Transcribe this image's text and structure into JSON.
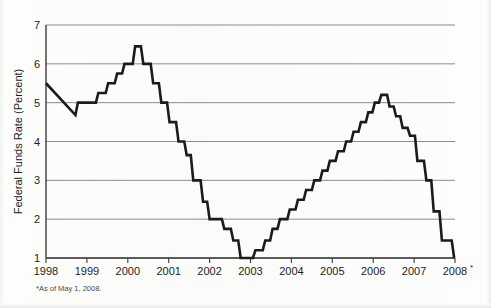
{
  "chart_data": {
    "type": "line",
    "subtype": "step",
    "title": "",
    "xlabel": "",
    "ylabel": "Federal Funds Rate (Percent)",
    "ylim": [
      1,
      7
    ],
    "xlim": [
      1998,
      2008
    ],
    "yticks": [
      1,
      2,
      3,
      4,
      5,
      6,
      7
    ],
    "ytick_labels": [
      "1",
      "2",
      "3",
      "4",
      "5",
      "6",
      "7"
    ],
    "xticks": [
      1998,
      1999,
      2000,
      2001,
      2002,
      2003,
      2004,
      2005,
      2006,
      2007,
      2008
    ],
    "xtick_labels": [
      "1998",
      "1999",
      "2000",
      "2001",
      "2002",
      "2003",
      "2004",
      "2005",
      "2006",
      "2007",
      "2008"
    ],
    "grid": "horizontal",
    "legend": "none",
    "line_color": "#1b1b1b",
    "grid_color": "#6f6f6f",
    "footnote_marker": "*",
    "footnote": "*As of May 1, 2008.",
    "x_last_label_marker": "*",
    "series": [
      {
        "name": "Federal Funds Rate",
        "points": [
          [
            1998.0,
            5.5
          ],
          [
            1998.72,
            4.68
          ],
          [
            1998.78,
            5.0
          ],
          [
            1999.22,
            5.0
          ],
          [
            1999.28,
            5.25
          ],
          [
            1999.46,
            5.25
          ],
          [
            1999.52,
            5.5
          ],
          [
            1999.68,
            5.5
          ],
          [
            1999.74,
            5.75
          ],
          [
            1999.86,
            5.75
          ],
          [
            1999.92,
            6.0
          ],
          [
            2000.12,
            6.0
          ],
          [
            2000.18,
            6.45
          ],
          [
            2000.32,
            6.45
          ],
          [
            2000.38,
            6.0
          ],
          [
            2000.56,
            6.0
          ],
          [
            2000.62,
            5.5
          ],
          [
            2000.76,
            5.5
          ],
          [
            2000.82,
            5.0
          ],
          [
            2000.96,
            5.0
          ],
          [
            2001.02,
            4.5
          ],
          [
            2001.18,
            4.5
          ],
          [
            2001.24,
            4.0
          ],
          [
            2001.38,
            4.0
          ],
          [
            2001.44,
            3.65
          ],
          [
            2001.54,
            3.65
          ],
          [
            2001.6,
            3.0
          ],
          [
            2001.78,
            3.0
          ],
          [
            2001.84,
            2.45
          ],
          [
            2001.94,
            2.45
          ],
          [
            2002.0,
            2.0
          ],
          [
            2002.3,
            2.0
          ],
          [
            2002.36,
            1.75
          ],
          [
            2002.52,
            1.75
          ],
          [
            2002.58,
            1.45
          ],
          [
            2002.7,
            1.45
          ],
          [
            2002.76,
            1.0
          ],
          [
            2003.06,
            1.0
          ],
          [
            2003.12,
            1.2
          ],
          [
            2003.3,
            1.2
          ],
          [
            2003.36,
            1.45
          ],
          [
            2003.48,
            1.45
          ],
          [
            2003.54,
            1.75
          ],
          [
            2003.66,
            1.75
          ],
          [
            2003.72,
            2.0
          ],
          [
            2003.9,
            2.0
          ],
          [
            2003.96,
            2.25
          ],
          [
            2004.1,
            2.25
          ],
          [
            2004.16,
            2.5
          ],
          [
            2004.3,
            2.5
          ],
          [
            2004.36,
            2.75
          ],
          [
            2004.5,
            2.75
          ],
          [
            2004.56,
            3.0
          ],
          [
            2004.7,
            3.0
          ],
          [
            2004.76,
            3.25
          ],
          [
            2004.88,
            3.25
          ],
          [
            2004.94,
            3.5
          ],
          [
            2005.08,
            3.5
          ],
          [
            2005.14,
            3.75
          ],
          [
            2005.28,
            3.75
          ],
          [
            2005.34,
            4.0
          ],
          [
            2005.46,
            4.0
          ],
          [
            2005.52,
            4.25
          ],
          [
            2005.64,
            4.25
          ],
          [
            2005.7,
            4.5
          ],
          [
            2005.82,
            4.5
          ],
          [
            2005.88,
            4.75
          ],
          [
            2005.98,
            4.75
          ],
          [
            2006.04,
            5.0
          ],
          [
            2006.14,
            5.0
          ],
          [
            2006.2,
            5.2
          ],
          [
            2006.34,
            5.2
          ],
          [
            2006.4,
            4.9
          ],
          [
            2006.5,
            4.9
          ],
          [
            2006.56,
            4.65
          ],
          [
            2006.66,
            4.65
          ],
          [
            2006.72,
            4.35
          ],
          [
            2006.84,
            4.35
          ],
          [
            2006.9,
            4.15
          ],
          [
            2007.02,
            4.15
          ],
          [
            2007.08,
            3.5
          ],
          [
            2007.24,
            3.5
          ],
          [
            2007.3,
            3.0
          ],
          [
            2007.42,
            3.0
          ],
          [
            2007.48,
            2.2
          ],
          [
            2007.62,
            2.2
          ],
          [
            2007.68,
            1.45
          ],
          [
            2007.92,
            1.45
          ],
          [
            2007.98,
            1.0
          ]
        ],
        "key_values": {
          "start_1998": 5.5,
          "trough_late_1998": 4.68,
          "peak_2000": 6.45,
          "trough_2003": 1.0,
          "peak_2006": 5.2,
          "end_2008": 2.0
        }
      }
    ]
  },
  "plot": {
    "left": 46,
    "right": 455,
    "top": 25,
    "bottom": 258
  }
}
